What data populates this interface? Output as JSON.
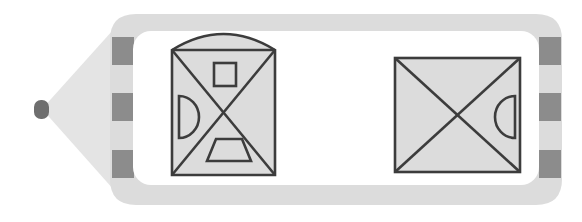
{
  "canvas": {
    "width": 582,
    "height": 222,
    "background": "#ffffff",
    "title": "Dashed arrow tag containing two crossed-square glyphs"
  },
  "palette": {
    "tag_fill": "#dcdcdc",
    "tag_fill_light": "#e4e4e4",
    "panel_fill": "#ffffff",
    "dash_fill": "#8c8c8c",
    "tip_nub_fill": "#6e6e6e",
    "glyph_fill": "#dcdcdc",
    "glyph_stroke": "#3c3c3c",
    "inner_shape_fill": "#dcdcdc",
    "inner_shape_stroke": "#3c3c3c"
  },
  "tag": {
    "name": "arrow-tag-outline",
    "tip_x": 42,
    "tip_y": 109,
    "body_left": 110,
    "body_right": 562,
    "body_top": 14,
    "body_bottom": 205,
    "corner_radius": 26,
    "stroke_width": 0
  },
  "tip_nub": {
    "name": "tip-nub",
    "x": 34,
    "y": 100,
    "width": 15,
    "height": 19,
    "radius": 7
  },
  "panel": {
    "name": "inner-white-panel",
    "x": 133,
    "y": 31,
    "width": 406,
    "height": 154,
    "corner_radius": 18
  },
  "dashes": {
    "left": [
      {
        "x": 112,
        "y": 37,
        "width": 22,
        "height": 28
      },
      {
        "x": 112,
        "y": 93,
        "width": 22,
        "height": 28
      },
      {
        "x": 112,
        "y": 150,
        "width": 22,
        "height": 28
      }
    ],
    "right": [
      {
        "x": 539,
        "y": 37,
        "width": 22,
        "height": 28
      },
      {
        "x": 539,
        "y": 93,
        "width": 22,
        "height": 28
      },
      {
        "x": 539,
        "y": 150,
        "width": 22,
        "height": 28
      }
    ]
  },
  "glyphs": [
    {
      "name": "glyph-left-arched-crossed-square",
      "square": {
        "x": 172,
        "y": 50,
        "width": 103,
        "height": 125
      },
      "arc": {
        "enabled": true,
        "rise": 16
      },
      "diagonals": true,
      "inner_shapes": [
        {
          "name": "inner-square",
          "type": "square",
          "x": 214,
          "y": 63,
          "width": 22,
          "height": 23
        },
        {
          "name": "inner-semicircle-left",
          "type": "semicircle",
          "orientation": "bulge-right",
          "x": 179,
          "y": 96,
          "width": 20,
          "height": 42
        },
        {
          "name": "inner-trapezoid",
          "type": "trapezoid",
          "x": 207,
          "y": 139,
          "width": 44,
          "height": 22,
          "top_inset": 9
        }
      ]
    },
    {
      "name": "glyph-right-crossed-square",
      "square": {
        "x": 395,
        "y": 58,
        "width": 125,
        "height": 114
      },
      "arc": {
        "enabled": false,
        "rise": 0
      },
      "diagonals": true,
      "inner_shapes": [
        {
          "name": "inner-semicircle-right",
          "type": "semicircle",
          "orientation": "bulge-left",
          "x": 495,
          "y": 96,
          "width": 20,
          "height": 42
        }
      ]
    }
  ]
}
